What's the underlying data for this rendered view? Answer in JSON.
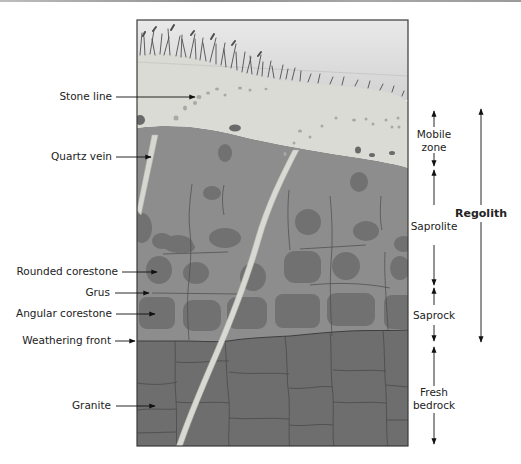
{
  "figure": {
    "type": "soil-weathering-profile",
    "colors": {
      "sky_top": "#e8e8e8",
      "sky_bottom": "#d4d4d4",
      "mobile_zone": "#dadad4",
      "saprolite": "#8e8e8e",
      "corestone": "#6f6f6f",
      "bedrock": "#707070",
      "quartz_vein": "#d8d8d8",
      "grass": "#555555",
      "frame": "#3a3a3a"
    }
  },
  "left_labels": [
    {
      "id": "stone-line",
      "text": "Stone line"
    },
    {
      "id": "quartz-vein",
      "text": "Quartz vein"
    },
    {
      "id": "rounded-corestone",
      "text": "Rounded corestone"
    },
    {
      "id": "grus",
      "text": "Grus"
    },
    {
      "id": "angular-corestone",
      "text": "Angular corestone"
    },
    {
      "id": "weathering-front",
      "text": "Weathering front"
    },
    {
      "id": "granite",
      "text": "Granite"
    }
  ],
  "right_zones": [
    {
      "id": "mobile-zone",
      "line1": "Mobile",
      "line2": "zone"
    },
    {
      "id": "saprolite",
      "line1": "Saprolite"
    },
    {
      "id": "saprock",
      "line1": "Saprock"
    },
    {
      "id": "fresh-bedrock",
      "line1": "Fresh",
      "line2": "bedrock"
    }
  ],
  "bracket": {
    "id": "regolith",
    "text": "Regolith"
  }
}
